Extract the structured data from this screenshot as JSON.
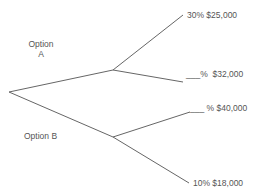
{
  "diagram": {
    "type": "decision-tree",
    "line_color": "#666666",
    "text_color": "#555555",
    "options": [
      {
        "label_line1": "Option",
        "label_line2": "A",
        "outcomes": [
          {
            "probability": "30%",
            "payoff": "$25,000",
            "text": "30% $25,000"
          },
          {
            "probability": "___%",
            "payoff": "$32,000",
            "text": "___%  $32,000"
          }
        ]
      },
      {
        "label_line1": "Option B",
        "outcomes": [
          {
            "probability": "___ %",
            "payoff": "$40,000",
            "text": "___ % $40,000"
          },
          {
            "probability": "10%",
            "payoff": "$18,000",
            "text": "10% $18,000"
          }
        ]
      }
    ]
  }
}
